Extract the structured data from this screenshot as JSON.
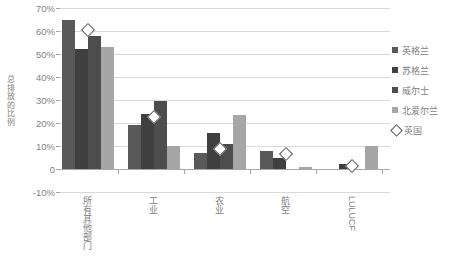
{
  "chart_data": {
    "type": "bar",
    "title": "",
    "xlabel": "",
    "ylabel": "总排放的比例",
    "ylim": [
      -10,
      70
    ],
    "ytick_values": [
      -10,
      0,
      10,
      20,
      30,
      40,
      50,
      60,
      70
    ],
    "ytick_labels": [
      "-10%",
      "0",
      "10%",
      "20%",
      "30%",
      "40%",
      "50%",
      "60%",
      "70%"
    ],
    "grid": true,
    "legend_position": "right",
    "categories": [
      "所有其他部门",
      "工业",
      "农业",
      "航空",
      "LULUCF"
    ],
    "series": [
      {
        "name": "英格兰",
        "color": "#595959",
        "values": [
          65,
          19,
          7,
          8,
          0
        ]
      },
      {
        "name": "苏格兰",
        "color": "#3f3f3f",
        "values": [
          52,
          24,
          15.5,
          5,
          2
        ]
      },
      {
        "name": "威尔士",
        "color": "#4d4d4d",
        "values": [
          58,
          29.5,
          11,
          0,
          0
        ]
      },
      {
        "name": "北爱尔兰",
        "color": "#a6a6a6",
        "values": [
          53,
          10,
          23.5,
          1,
          10
        ]
      }
    ],
    "marker_series": {
      "name": "英国",
      "marker": "diamond",
      "color": "#595959",
      "values": [
        60.5,
        22.5,
        8.5,
        6.5,
        1.5
      ]
    }
  },
  "legend": {
    "items": [
      {
        "label": "英格兰",
        "swatch_color": "#595959",
        "marker": "square"
      },
      {
        "label": "苏格兰",
        "swatch_color": "#3f3f3f",
        "marker": "square"
      },
      {
        "label": "威尔士",
        "swatch_color": "#4d4d4d",
        "marker": "square"
      },
      {
        "label": "北爱尔兰",
        "swatch_color": "#a6a6a6",
        "marker": "square"
      },
      {
        "label": "英国",
        "swatch_color": "#ffffff",
        "marker": "diamond"
      }
    ]
  }
}
